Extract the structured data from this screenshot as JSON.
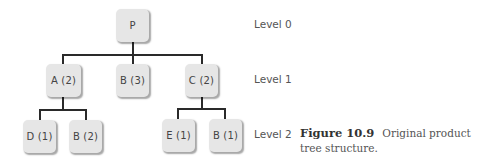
{
  "diagram": {
    "type": "product-tree",
    "levels": [
      {
        "label": "Level 0"
      },
      {
        "label": "Level 1"
      },
      {
        "label": "Level 2"
      }
    ],
    "nodes": {
      "p": {
        "label": "P",
        "level": 0
      },
      "a": {
        "label": "A (2)",
        "level": 1,
        "parent": "P"
      },
      "b3": {
        "label": "B (3)",
        "level": 1,
        "parent": "P"
      },
      "c": {
        "label": "C (2)",
        "level": 1,
        "parent": "P"
      },
      "d": {
        "label": "D (1)",
        "level": 2,
        "parent": "A"
      },
      "b2": {
        "label": "B (2)",
        "level": 2,
        "parent": "A"
      },
      "e": {
        "label": "E (1)",
        "level": 2,
        "parent": "C"
      },
      "b1": {
        "label": "B (1)",
        "level": 2,
        "parent": "C"
      }
    },
    "colors": {
      "node_fill": "#e6e6e6",
      "connector": "#2a2a2a",
      "text": "#444444"
    }
  },
  "caption": {
    "figure_number": "Figure 10.9",
    "text": "Original product tree structure."
  }
}
